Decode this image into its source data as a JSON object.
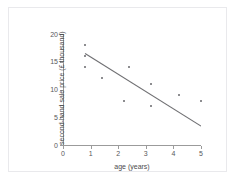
{
  "figure": {
    "background_color": "#ffffff",
    "border_color": "#e9e9ec",
    "axis_color": "#9b9b9b",
    "point_color": "#8d8d90",
    "line_color": "#6f6f72",
    "text_color": "#4b4b4d"
  },
  "chart_data": {
    "type": "scatter",
    "title": "",
    "xlabel": "age (years)",
    "ylabel": "second-hand sale price (£ thousand)",
    "xlim": [
      0,
      5
    ],
    "ylim": [
      0,
      20
    ],
    "xticks": [
      0,
      1,
      2,
      3,
      4,
      5
    ],
    "yticks": [
      0,
      5,
      10,
      15,
      20
    ],
    "xtick_labels": [
      "0",
      "1",
      "2",
      "3",
      "4",
      "5"
    ],
    "ytick_labels": [
      "0",
      "5",
      "10",
      "15",
      "20"
    ],
    "grid": false,
    "legend": false,
    "points": [
      {
        "x": 0.8,
        "y": 18
      },
      {
        "x": 0.8,
        "y": 16
      },
      {
        "x": 0.8,
        "y": 14
      },
      {
        "x": 1.4,
        "y": 12
      },
      {
        "x": 2.2,
        "y": 8
      },
      {
        "x": 2.4,
        "y": 14
      },
      {
        "x": 3.2,
        "y": 11
      },
      {
        "x": 3.2,
        "y": 7
      },
      {
        "x": 4.2,
        "y": 9
      },
      {
        "x": 5.0,
        "y": 8
      }
    ],
    "trend_line": {
      "type": "line-of-best-fit",
      "x_start": 0.8,
      "y_start": 16.5,
      "x_end": 5.0,
      "y_end": 3.4
    }
  }
}
